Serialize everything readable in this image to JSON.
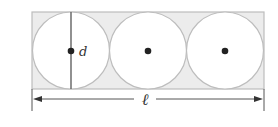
{
  "diagram": {
    "labels": {
      "diameter": "d",
      "length": "ℓ"
    },
    "shapes": {
      "rectangle": {
        "x": 32,
        "y": 12,
        "width": 232,
        "height": 77
      },
      "circles": [
        {
          "cx": 71,
          "cy": 50.5,
          "r": 38.5
        },
        {
          "cx": 148,
          "cy": 50.5,
          "r": 38.5
        },
        {
          "cx": 225,
          "cy": 50.5,
          "r": 38.5
        }
      ],
      "count": 3
    },
    "colors": {
      "fill": "#ececec",
      "stroke": "#bdbdbd",
      "line": "#555555",
      "dot": "#222222",
      "background": "#ffffff"
    }
  }
}
